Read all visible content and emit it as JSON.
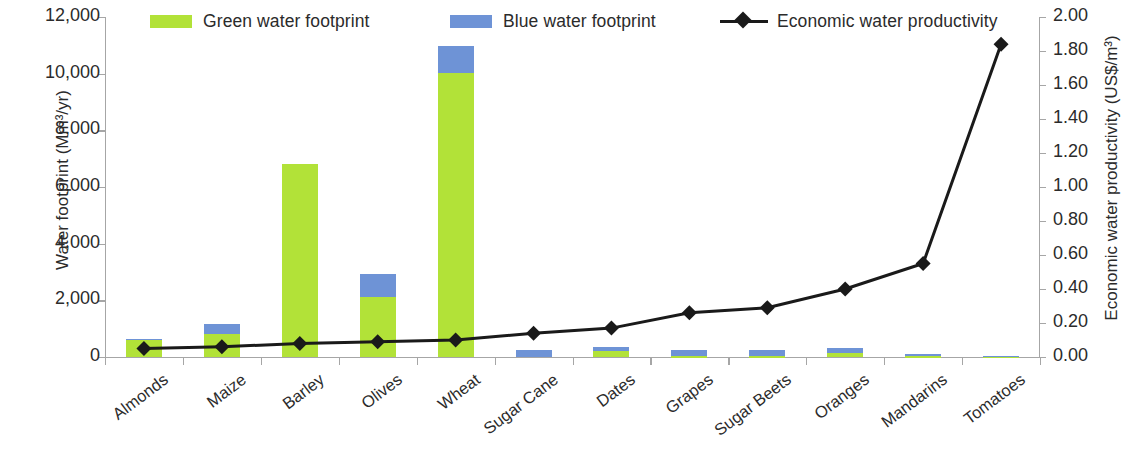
{
  "legend": {
    "items": [
      {
        "label": "Green water footprint",
        "type": "swatch",
        "color": "#b2e238",
        "icon": "green-swatch-icon"
      },
      {
        "label": "Blue water footprint",
        "type": "swatch",
        "color": "#6e93d6",
        "icon": "blue-swatch-icon"
      },
      {
        "label": "Economic water productivity",
        "type": "line-marker",
        "color": "#1a1a1a",
        "icon": "line-diamond-marker-icon"
      }
    ]
  },
  "axes": {
    "left_title": "Water footprint (Mm³/yr)",
    "right_title": "Economic water productivity (US$/m³)",
    "left_ticks": [
      "0",
      "2,000",
      "4,000",
      "6,000",
      "8,000",
      "10,000",
      "12,000"
    ],
    "right_ticks": [
      "0.00",
      "0.20",
      "0.40",
      "0.60",
      "0.80",
      "1.00",
      "1.20",
      "1.40",
      "1.60",
      "1.80",
      "2.00"
    ]
  },
  "chart_data": {
    "type": "bar",
    "title": "",
    "xlabel": "",
    "ylabel": "Water footprint (Mm³/yr)",
    "y2label": "Economic water productivity (US$/m³)",
    "ylim": [
      0,
      12000
    ],
    "y2lim": [
      0,
      2.0
    ],
    "grid": false,
    "legend_position": "top",
    "stacked": true,
    "categories": [
      "Almonds",
      "Maize",
      "Barley",
      "Olives",
      "Wheat",
      "Sugar Cane",
      "Dates",
      "Grapes",
      "Sugar Beets",
      "Oranges",
      "Mandarins",
      "Tomatoes"
    ],
    "series": [
      {
        "name": "Green water footprint",
        "type": "bar",
        "axis": "left",
        "color": "#b2e238",
        "values": [
          600,
          820,
          6800,
          2120,
          10020,
          0,
          220,
          20,
          30,
          140,
          20,
          10
        ]
      },
      {
        "name": "Blue water footprint",
        "type": "bar",
        "axis": "left",
        "color": "#6e93d6",
        "values": [
          50,
          330,
          0,
          810,
          950,
          240,
          150,
          230,
          220,
          180,
          90,
          30
        ]
      },
      {
        "name": "Economic water productivity",
        "type": "line",
        "axis": "right",
        "color": "#1a1a1a",
        "marker": "diamond",
        "values": [
          0.05,
          0.06,
          0.08,
          0.09,
          0.1,
          0.14,
          0.17,
          0.26,
          0.29,
          0.4,
          0.55,
          1.84
        ]
      }
    ]
  }
}
